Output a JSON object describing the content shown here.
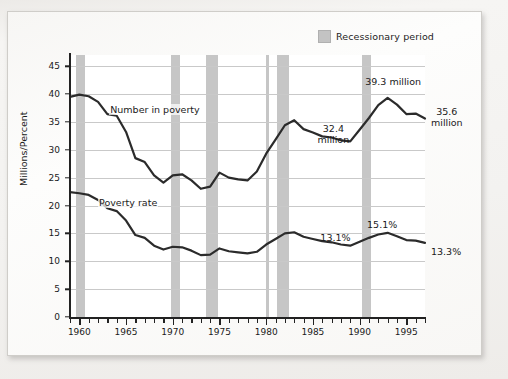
{
  "legend": {
    "swatch_name": "recession-swatch",
    "label": "Recessionary period",
    "swatch_color": "#c6c6c6"
  },
  "axes": {
    "y_title": "Millions/Percent",
    "y_ticks": [
      "0",
      "5",
      "10",
      "15",
      "20",
      "25",
      "30",
      "35",
      "40",
      "45"
    ],
    "x_ticks": [
      "1960",
      "1965",
      "1970",
      "1975",
      "1980",
      "1985",
      "1990",
      "1995"
    ]
  },
  "series_labels": {
    "number_in_poverty": "Number in poverty",
    "poverty_rate": "Poverty rate"
  },
  "annotations": {
    "number_1983_peak": "32.4\nmillion",
    "number_1993_peak": "39.3 million",
    "number_end": "35.6\nmillion",
    "rate_1989": "13.1%",
    "rate_1993": "15.1%",
    "rate_end": "13.3%"
  },
  "chart_data": {
    "type": "line",
    "title": "",
    "xlabel": "",
    "ylabel": "Millions/Percent",
    "xlim": [
      1959,
      1997
    ],
    "ylim": [
      0,
      47
    ],
    "ytick_step": 5,
    "grid": true,
    "legend_position": "top-right",
    "x": [
      1959,
      1960,
      1961,
      1962,
      1963,
      1964,
      1965,
      1966,
      1967,
      1968,
      1969,
      1970,
      1971,
      1972,
      1973,
      1974,
      1975,
      1976,
      1977,
      1978,
      1979,
      1980,
      1981,
      1982,
      1983,
      1984,
      1985,
      1986,
      1987,
      1988,
      1989,
      1990,
      1991,
      1992,
      1993,
      1994,
      1995,
      1996,
      1997
    ],
    "series": [
      {
        "name": "Number in poverty",
        "unit": "millions",
        "values": [
          39.5,
          39.9,
          39.6,
          38.6,
          36.4,
          36.1,
          33.2,
          28.5,
          27.8,
          25.4,
          24.1,
          25.4,
          25.6,
          24.5,
          23.0,
          23.4,
          25.9,
          25.0,
          24.7,
          24.5,
          26.1,
          29.3,
          31.8,
          34.4,
          35.3,
          33.7,
          33.1,
          32.4,
          32.2,
          31.7,
          31.5,
          33.6,
          35.7,
          38.0,
          39.3,
          38.1,
          36.4,
          36.5,
          35.6
        ]
      },
      {
        "name": "Poverty rate",
        "unit": "percent",
        "values": [
          22.4,
          22.2,
          21.9,
          21.0,
          19.5,
          19.0,
          17.3,
          14.7,
          14.2,
          12.8,
          12.1,
          12.6,
          12.5,
          11.9,
          11.1,
          11.2,
          12.3,
          11.8,
          11.6,
          11.4,
          11.7,
          13.0,
          14.0,
          15.0,
          15.2,
          14.4,
          14.0,
          13.6,
          13.4,
          13.0,
          12.8,
          13.5,
          14.2,
          14.8,
          15.1,
          14.5,
          13.8,
          13.7,
          13.3
        ]
      }
    ],
    "recession_bands": [
      {
        "start": 1959.6,
        "end": 1960.6
      },
      {
        "start": 1969.8,
        "end": 1970.8
      },
      {
        "start": 1973.6,
        "end": 1974.8
      },
      {
        "start": 1980.0,
        "end": 1980.35
      },
      {
        "start": 1981.2,
        "end": 1982.4
      },
      {
        "start": 1990.3,
        "end": 1991.2
      }
    ],
    "point_labels": [
      {
        "series": "Number in poverty",
        "x": 1987,
        "value": 32.4,
        "text": "32.4 million"
      },
      {
        "series": "Number in poverty",
        "x": 1993,
        "value": 39.3,
        "text": "39.3 million"
      },
      {
        "series": "Number in poverty",
        "x": 1997,
        "value": 35.6,
        "text": "35.6 million"
      },
      {
        "series": "Poverty rate",
        "x": 1989,
        "value": 13.1,
        "text": "13.1%"
      },
      {
        "series": "Poverty rate",
        "x": 1993,
        "value": 15.1,
        "text": "15.1%"
      },
      {
        "series": "Poverty rate",
        "x": 1997,
        "value": 13.3,
        "text": "13.3%"
      }
    ]
  }
}
